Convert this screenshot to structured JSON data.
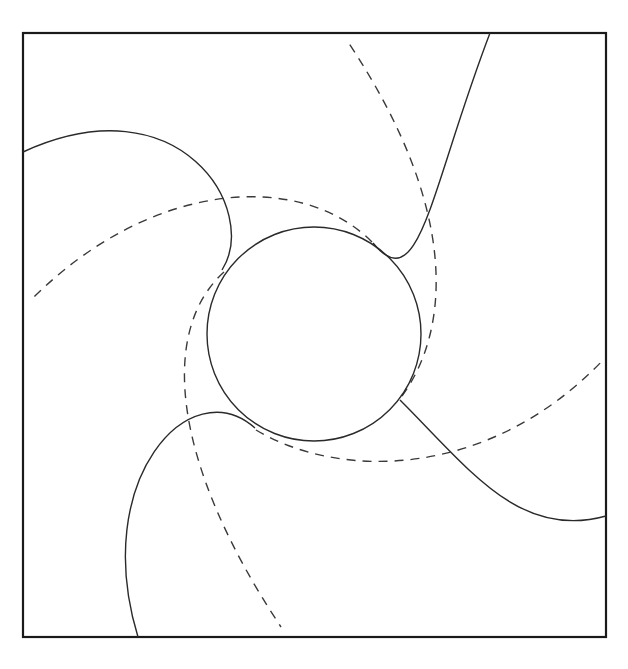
{
  "diagram": {
    "type": "rotationally-symmetric spiral vane diagram",
    "symmetry": "4-fold rotational",
    "frame": {
      "x": 23,
      "y": 33,
      "width": 583,
      "height": 604,
      "stroke": "#1a1a1a"
    },
    "hub_circle": {
      "cx": 314,
      "cy": 334,
      "r": 107,
      "stroke": "#2a2a2a"
    },
    "solid_curves": [
      {
        "name": "vane-top",
        "d": "M 373 243 C 420 300, 430 190, 490 33"
      },
      {
        "name": "vane-right",
        "d": "M 400 400 C 470 470, 520 540, 606 516"
      },
      {
        "name": "vane-bottom",
        "d": "M 255 428 C 190 370, 90 480, 138 637"
      },
      {
        "name": "vane-left",
        "d": "M 222 270 C 260 210, 180 80, 23 152"
      }
    ],
    "dashed_curves": [
      {
        "name": "streamline-top",
        "d": "M 402 396 C 450 330, 460 210, 348 42"
      },
      {
        "name": "streamline-right",
        "d": "M 256 430 C 340 480, 490 480, 605 358"
      },
      {
        "name": "streamline-bottom",
        "d": "M 224 272 C 160 330, 170 460, 281 627"
      },
      {
        "name": "streamline-left",
        "d": "M 372 242 C 300 170, 150 180, 31 300"
      }
    ],
    "colors": {
      "background": "#ffffff",
      "line": "#2a2a2a"
    }
  }
}
